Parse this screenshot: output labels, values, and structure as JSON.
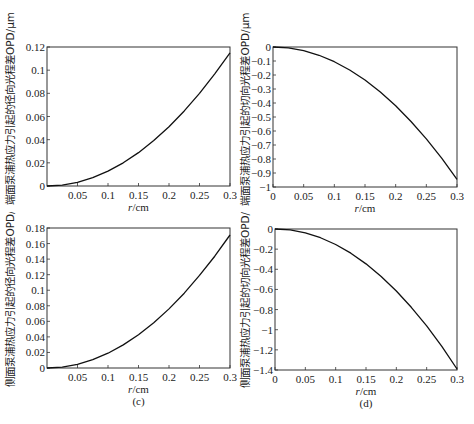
{
  "figure": {
    "panels": [
      "a",
      "b",
      "c",
      "d"
    ]
  },
  "chart_data": [
    {
      "id": "a",
      "type": "line",
      "caption": "(a)",
      "title": "",
      "xlabel_italic": "r",
      "xlabel_unit": "/cm",
      "xlabel": "r/cm",
      "ylabel": "端面泵浦热应力引起的径向光程差OPD/μm",
      "xlim": [
        0,
        0.3
      ],
      "ylim": [
        0,
        0.12
      ],
      "xticks": [
        0.05,
        0.1,
        0.15,
        0.2,
        0.25,
        0.3
      ],
      "xtick_labels": [
        "0.05",
        "0.1",
        "0.15",
        "0.2",
        "0.25",
        "0.3"
      ],
      "yticks": [
        0,
        0.02,
        0.04,
        0.06,
        0.08,
        0.1,
        0.12
      ],
      "ytick_labels": [
        "0",
        "0.02",
        "0.04",
        "0.06",
        "0.08",
        "0.1",
        "0.12"
      ],
      "grid": false,
      "series": [
        {
          "name": "radial OPD (end-pumped)",
          "x": [
            0,
            0.025,
            0.05,
            0.075,
            0.1,
            0.125,
            0.15,
            0.175,
            0.2,
            0.225,
            0.25,
            0.275,
            0.3
          ],
          "values": [
            0,
            0.0008,
            0.0032,
            0.0072,
            0.0128,
            0.02,
            0.0288,
            0.0392,
            0.0512,
            0.0648,
            0.08,
            0.0968,
            0.115
          ]
        }
      ]
    },
    {
      "id": "b",
      "type": "line",
      "caption": "(b)",
      "title": "",
      "xlabel_italic": "r",
      "xlabel_unit": "/cm",
      "xlabel": "r/cm",
      "ylabel": "端面泵浦热应力引起的切向光程差OPD/μm",
      "xlim": [
        0,
        0.3
      ],
      "ylim": [
        -1,
        0
      ],
      "xticks": [
        0,
        0.05,
        0.1,
        0.15,
        0.2,
        0.25,
        0.3
      ],
      "xtick_labels": [
        "0",
        "0.05",
        "0.1",
        "0.15",
        "0.2",
        "0.25",
        "0.3"
      ],
      "yticks": [
        0,
        -0.1,
        -0.2,
        -0.3,
        -0.4,
        -0.5,
        -0.6,
        -0.7,
        -0.8,
        -0.9,
        -1
      ],
      "ytick_labels": [
        "0",
        "-0.1",
        "-0.2",
        "-0.3",
        "-0.4",
        "-0.5",
        "-0.6",
        "-0.7",
        "-0.8",
        "-0.9",
        "-1"
      ],
      "grid": false,
      "series": [
        {
          "name": "tangential OPD (end-pumped)",
          "x": [
            0,
            0.025,
            0.05,
            0.075,
            0.1,
            0.125,
            0.15,
            0.175,
            0.2,
            0.225,
            0.25,
            0.275,
            0.3
          ],
          "values": [
            0,
            -0.0066,
            -0.026,
            -0.059,
            -0.105,
            -0.164,
            -0.236,
            -0.322,
            -0.42,
            -0.532,
            -0.656,
            -0.794,
            -0.945
          ]
        }
      ]
    },
    {
      "id": "c",
      "type": "line",
      "caption": "(c)",
      "title": "",
      "xlabel_italic": "r",
      "xlabel_unit": "/cm",
      "xlabel": "r/cm",
      "ylabel": "侧面泵浦热应力引起的径向光程差OPD/μm",
      "xlim": [
        0,
        0.3
      ],
      "ylim": [
        0,
        0.18
      ],
      "xticks": [
        0.05,
        0.1,
        0.15,
        0.2,
        0.25,
        0.3
      ],
      "xtick_labels": [
        "0.05",
        "0.1",
        "0.15",
        "0.2",
        "0.25",
        "0.3"
      ],
      "yticks": [
        0,
        0.02,
        0.04,
        0.06,
        0.08,
        0.1,
        0.12,
        0.14,
        0.16,
        0.18
      ],
      "ytick_labels": [
        "0",
        "0.02",
        "0.04",
        "0.06",
        "0.08",
        "0.1",
        "0.12",
        "0.14",
        "0.16",
        "0.18"
      ],
      "grid": false,
      "series": [
        {
          "name": "radial OPD (side-pumped)",
          "x": [
            0,
            0.025,
            0.05,
            0.075,
            0.1,
            0.125,
            0.15,
            0.175,
            0.2,
            0.225,
            0.25,
            0.275,
            0.3
          ],
          "values": [
            0,
            0.0012,
            0.0048,
            0.0107,
            0.019,
            0.0297,
            0.0428,
            0.0582,
            0.076,
            0.0962,
            0.119,
            0.1437,
            0.171
          ]
        }
      ]
    },
    {
      "id": "d",
      "type": "line",
      "caption": "(d)",
      "title": "",
      "xlabel_italic": "r",
      "xlabel_unit": "/cm",
      "xlabel": "r/cm",
      "ylabel": "侧面泵浦热应力引起的切向光程差OPD/μm",
      "xlim": [
        0,
        0.3
      ],
      "ylim": [
        -1.4,
        0
      ],
      "xticks": [
        0,
        0.05,
        0.1,
        0.15,
        0.2,
        0.25,
        0.3
      ],
      "xtick_labels": [
        "0",
        "0.05",
        "0.1",
        "0.15",
        "0.2",
        "0.25",
        "0.3"
      ],
      "yticks": [
        0,
        -0.2,
        -0.4,
        -0.6,
        -0.8,
        -1,
        -1.2,
        -1.4
      ],
      "ytick_labels": [
        "0",
        "-0.2",
        "-0.4",
        "-0.6",
        "-0.8",
        "-1",
        "-1.2",
        "-1.4"
      ],
      "grid": false,
      "series": [
        {
          "name": "tangential OPD (side-pumped)",
          "x": [
            0,
            0.025,
            0.05,
            0.075,
            0.1,
            0.125,
            0.15,
            0.175,
            0.2,
            0.225,
            0.25,
            0.275,
            0.3
          ],
          "values": [
            0,
            -0.0096,
            -0.0385,
            -0.0866,
            -0.154,
            -0.24,
            -0.346,
            -0.471,
            -0.616,
            -0.78,
            -0.962,
            -1.165,
            -1.39
          ]
        }
      ]
    }
  ]
}
